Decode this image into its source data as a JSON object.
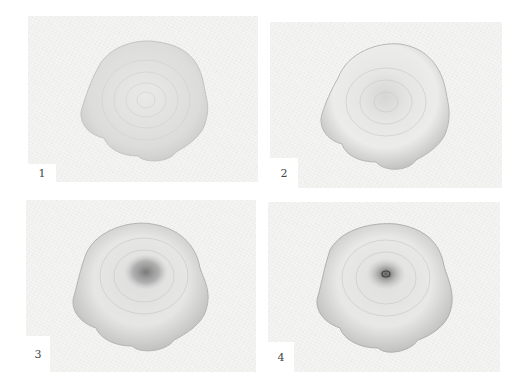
{
  "figure": {
    "panels": [
      {
        "id": 1,
        "label": "1",
        "stage": "light outline and spiral texture"
      },
      {
        "id": 2,
        "label": "2",
        "stage": "added mid-tone shading on rim and center"
      },
      {
        "id": 3,
        "label": "3",
        "stage": "dark shaded center added"
      },
      {
        "id": 4,
        "label": "4",
        "stage": "center detail refined with dark core"
      }
    ],
    "colors": {
      "paper": "#f4f4f3",
      "background": "#ffffff",
      "graphite_light": "#d8d8d6",
      "graphite_mid": "#b9b9b7",
      "graphite_dark": "#6f6f6f"
    }
  }
}
